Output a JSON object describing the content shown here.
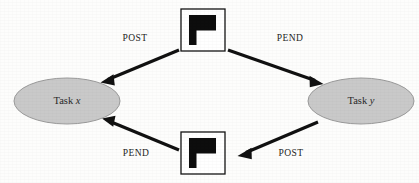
{
  "diagram": {
    "background_color": "#fdfdfc",
    "nodes": [
      {
        "id": "task-x",
        "type": "ellipse",
        "label_prefix": "Task ",
        "label_variable": "x",
        "label_full": "Task x",
        "fill_color": "#c9c9c9",
        "stroke_color": "#9a9a9a",
        "cx": 67,
        "cy": 101,
        "rx": 53,
        "ry": 23
      },
      {
        "id": "task-y",
        "type": "ellipse",
        "label_prefix": "Task ",
        "label_variable": "y",
        "label_full": "Task y",
        "fill_color": "#c9c9c9",
        "stroke_color": "#9a9a9a",
        "cx": 361,
        "cy": 101,
        "rx": 53,
        "ry": 23
      },
      {
        "id": "event-flag-top",
        "type": "event-box",
        "icon": "flag-icon",
        "fill_color": "#ffffff",
        "stroke_color": "#141414",
        "x": 181,
        "y": 9,
        "width": 44,
        "height": 42
      },
      {
        "id": "event-flag-bottom",
        "type": "event-box",
        "icon": "flag-icon",
        "fill_color": "#ffffff",
        "stroke_color": "#141414",
        "x": 181,
        "y": 132,
        "width": 44,
        "height": 42
      }
    ],
    "edges": [
      {
        "id": "edge-post-top",
        "label": "POST",
        "from": "event-flag-top",
        "to": "task-x",
        "label_x": 135,
        "label_y": 39,
        "x1": 179,
        "y1": 50,
        "x2": 102,
        "y2": 82
      },
      {
        "id": "edge-pend-top",
        "label": "PEND",
        "from": "event-flag-top",
        "to": "task-y",
        "label_x": 290,
        "label_y": 39,
        "x1": 228,
        "y1": 50,
        "x2": 322,
        "y2": 84
      },
      {
        "id": "edge-pend-bottom",
        "label": "PEND",
        "from": "event-flag-bottom",
        "to": "task-x",
        "label_x": 136,
        "label_y": 154,
        "x1": 179,
        "y1": 150,
        "x2": 104,
        "y2": 119
      },
      {
        "id": "edge-post-bottom",
        "label": "POST",
        "from": "task-y",
        "to": "event-flag-bottom",
        "label_x": 291,
        "label_y": 154,
        "x1": 318,
        "y1": 122,
        "x2": 238,
        "y2": 156
      }
    ]
  }
}
